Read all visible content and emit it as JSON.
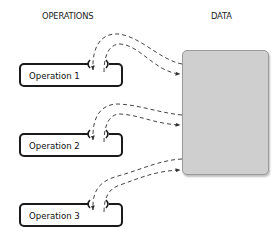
{
  "headers": {
    "operations": "OPERATIONS",
    "data": "DATA"
  },
  "operations": [
    {
      "label": "Operation 1"
    },
    {
      "label": "Operation 2"
    },
    {
      "label": "Operation 3"
    }
  ],
  "data_store": {
    "fill_color": "#cfcfcf",
    "border_color": "#9a9a9a"
  },
  "connections": [
    {
      "from": "Data",
      "to": "Operation 1",
      "style": "dashed",
      "arrow": "into operation"
    },
    {
      "from": "Operation 1",
      "to": "Data",
      "style": "dashed",
      "arrow": "into data"
    },
    {
      "from": "Data",
      "to": "Operation 2",
      "style": "dashed",
      "arrow": "into operation"
    },
    {
      "from": "Operation 2",
      "to": "Data",
      "style": "dashed",
      "arrow": "into data"
    },
    {
      "from": "Data",
      "to": "Operation 3",
      "style": "dashed",
      "arrow": "into operation"
    },
    {
      "from": "Operation 3",
      "to": "Data",
      "style": "dashed",
      "arrow": "into data"
    }
  ]
}
